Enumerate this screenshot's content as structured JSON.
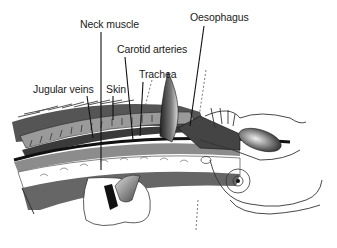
{
  "diagram": {
    "type": "anatomical-illustration",
    "labels": [
      {
        "id": "neck-muscle",
        "text": "Neck muscle",
        "x": 80,
        "y": 18
      },
      {
        "id": "carotid-arteries",
        "text": "Carotid arteries",
        "x": 117,
        "y": 43
      },
      {
        "id": "oesophagus",
        "text": "Oesophagus",
        "x": 190,
        "y": 11
      },
      {
        "id": "trachea",
        "text": "Trachea",
        "x": 139,
        "y": 68
      },
      {
        "id": "jugular-veins",
        "text": "Jugular veins",
        "x": 33,
        "y": 83
      },
      {
        "id": "skin",
        "text": "Skin",
        "x": 106,
        "y": 83
      }
    ],
    "colors": {
      "line": "#111111",
      "tissue_dark": "#4a4a4a",
      "tissue_mid": "#8a8a8a",
      "tissue_light": "#bdbdbd",
      "background": "#ffffff"
    }
  }
}
